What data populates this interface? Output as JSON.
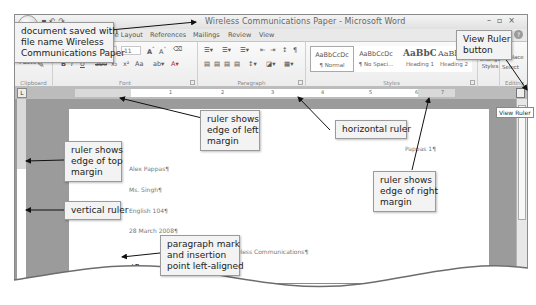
{
  "window": {
    "title": "Wireless Communications Paper - Microsoft Word",
    "controls": [
      "–",
      "▫",
      "×"
    ]
  },
  "ribbon": {
    "tabs": [
      "Home",
      "Insert",
      "Page Layout",
      "References",
      "Mailings",
      "Review",
      "View"
    ],
    "groups": {
      "clipboard": {
        "label": "Clipboard",
        "paste_label": "Paste"
      },
      "font": {
        "label": "Font",
        "font_size": "11",
        "buttons": [
          "B",
          "I",
          "U",
          "abe",
          "x₂",
          "x²",
          "Aa"
        ]
      },
      "paragraph": {
        "label": "Paragraph"
      },
      "styles": {
        "label": "Styles",
        "tiles": [
          {
            "sample": "AaBbCcDc",
            "name": "¶ Normal"
          },
          {
            "sample": "AaBbCcDc",
            "name": "¶ No Spaci..."
          },
          {
            "sample": "AaBbC",
            "name": "Heading 1"
          },
          {
            "sample": "AaBbCc",
            "name": "Heading 2"
          }
        ],
        "change_styles": "Change Styles"
      },
      "editing": {
        "label": "Editing",
        "replace": "Replace",
        "select": "Select"
      }
    }
  },
  "ruler": {
    "horizontal_numbers": [
      "1",
      "2",
      "3",
      "4",
      "5",
      "6",
      "7"
    ],
    "tooltip": "View Ruler"
  },
  "document": {
    "header_right": "Pappas 1¶",
    "lines": [
      "Alex Pappas¶",
      "Ms. Singh¶",
      "English 104¶",
      "28 March 2008¶"
    ],
    "title_line": "Wireless Communications¶",
    "insertion_mark": "¶"
  },
  "callouts": {
    "saved": [
      "document saved with",
      "file name Wireless",
      "Communications Paper"
    ],
    "view_ruler": [
      "View Ruler",
      "button"
    ],
    "left_margin": [
      "ruler shows",
      "edge of left",
      "margin"
    ],
    "horizontal_ruler": [
      "horizontal ruler"
    ],
    "top_margin": [
      "ruler shows",
      "edge of top",
      "margin"
    ],
    "right_margin": [
      "ruler shows",
      "edge of right",
      "margin"
    ],
    "vertical_ruler": [
      "vertical ruler"
    ],
    "paragraph_mark": [
      "paragraph mark",
      "and insertion",
      "point left-aligned"
    ]
  }
}
